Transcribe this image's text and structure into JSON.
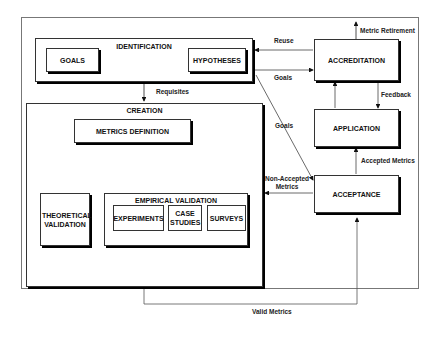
{
  "diagram": {
    "frame": "metrics-lifecycle",
    "nodes": {
      "identification": "IDENTIFICATION",
      "goals": "GOALS",
      "hypotheses": "HYPOTHESES",
      "creation": "CREATION",
      "metrics_definition": "METRICS DEFINITION",
      "theoretical_validation": "THEORETICAL VALIDATION",
      "empirical_validation": "EMPIRICAL VALIDATION",
      "experiments": "EXPERIMENTS",
      "case_studies": "CASE STUDIES",
      "surveys": "SURVEYS",
      "accreditation": "ACCREDITATION",
      "application": "APPLICATION",
      "acceptance": "ACCEPTANCE"
    },
    "edges": {
      "reuse": "Reuse",
      "goals_to_accreditation": "Goals",
      "goals_to_acceptance": "Goals",
      "requisites": "Requisites",
      "metric_retirement": "Metric Retirement",
      "feedback": "Feedback",
      "accepted_metrics": "Accepted Metrics",
      "non_accepted_metrics_line1": "Non-Accepted",
      "non_accepted_metrics_line2": "Metrics",
      "valid_metrics": "Valid Metrics"
    }
  }
}
